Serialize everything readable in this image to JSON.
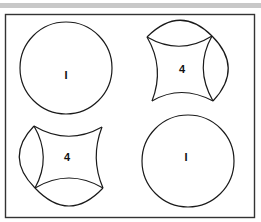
{
  "figure": {
    "frame_color": "#333333",
    "stroke_color": "#1a1a1a",
    "top_bar_color": "#c8c8c8",
    "panels": [
      {
        "id": "top-left",
        "shape": "circle",
        "label": "I"
      },
      {
        "id": "top-right",
        "shape": "circle-with-concave-square",
        "label": "4"
      },
      {
        "id": "bottom-left",
        "shape": "circle-with-concave-square",
        "label": "4"
      },
      {
        "id": "bottom-right",
        "shape": "circle",
        "label": "I"
      }
    ]
  }
}
